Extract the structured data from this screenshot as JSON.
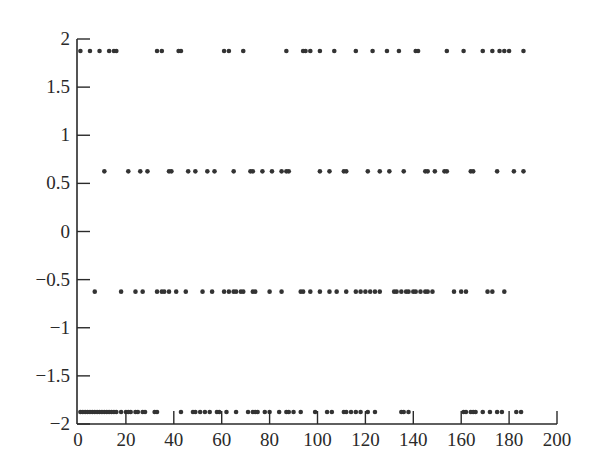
{
  "chart_data": {
    "type": "scatter",
    "title": "",
    "xlabel": "",
    "ylabel": "",
    "xlim": [
      0,
      200
    ],
    "ylim": [
      -2,
      2
    ],
    "grid": false,
    "legend": null,
    "x_ticks": [
      0,
      20,
      40,
      60,
      80,
      100,
      120,
      140,
      160,
      180,
      200
    ],
    "x_tick_labels": [
      "0",
      "20",
      "40",
      "60",
      "80",
      "100",
      "120",
      "140",
      "160",
      "180",
      "200"
    ],
    "y_ticks": [
      -2,
      -1.5,
      -1,
      -0.5,
      0,
      0.5,
      1,
      1.5,
      2
    ],
    "y_tick_labels": [
      "−2",
      "−1.5",
      "−1",
      "−0.5",
      "0",
      "0.5",
      "1",
      "1.5",
      "2"
    ],
    "marker_color": "#333333",
    "series": [
      {
        "name": "level 1.875",
        "y": 1.875,
        "x": [
          1,
          5,
          9,
          13,
          15,
          16,
          33,
          35,
          42,
          43,
          61,
          63,
          69,
          87,
          94,
          95,
          97,
          101,
          107,
          116,
          123,
          129,
          134,
          141,
          142,
          154,
          161,
          169,
          173,
          176,
          178,
          180,
          186
        ]
      },
      {
        "name": "level 0.625",
        "y": 0.625,
        "x": [
          11,
          21,
          26,
          29,
          38,
          39,
          46,
          49,
          54,
          57,
          65,
          72,
          73,
          77,
          81,
          85,
          87,
          88,
          101,
          105,
          111,
          112,
          121,
          126,
          130,
          136,
          145,
          146,
          149,
          153,
          154,
          164,
          165,
          175,
          182,
          186
        ]
      },
      {
        "name": "level -0.625",
        "y": -0.625,
        "x": [
          7,
          18,
          24,
          27,
          33,
          35,
          36,
          38,
          41,
          45,
          52,
          56,
          61,
          63,
          65,
          66,
          68,
          69,
          73,
          74,
          80,
          85,
          93,
          94,
          97,
          101,
          105,
          108,
          112,
          116,
          118,
          120,
          122,
          124,
          126,
          132,
          133,
          135,
          137,
          138,
          140,
          141,
          143,
          145,
          146,
          148,
          157,
          160,
          162,
          171,
          173,
          178
        ]
      },
      {
        "name": "level -1.875",
        "y": -1.875,
        "x": [
          1,
          2,
          3,
          4,
          5,
          6,
          7,
          8,
          9,
          10,
          11,
          12,
          13,
          14,
          15,
          16,
          18,
          20,
          21,
          22,
          24,
          25,
          27,
          28,
          32,
          33,
          43,
          48,
          49,
          51,
          53,
          55,
          58,
          59,
          62,
          66,
          71,
          73,
          74,
          75,
          78,
          80,
          84,
          87,
          88,
          90,
          93,
          99,
          104,
          106,
          111,
          112,
          114,
          116,
          118,
          121,
          124,
          135,
          136,
          138,
          161,
          162,
          164,
          165,
          166,
          169,
          172,
          175,
          177,
          183,
          185
        ]
      }
    ]
  }
}
